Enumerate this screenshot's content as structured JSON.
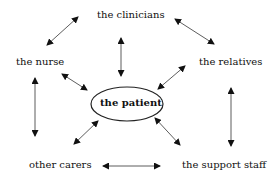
{
  "diagram": {
    "center": "the patient",
    "nodes": {
      "clinicians": "the clinicians",
      "nurse": "the nurse",
      "relatives": "the relatives",
      "carers": "other carers",
      "support": "the support staff"
    },
    "edges": [
      [
        "the clinicians",
        "the nurse"
      ],
      [
        "the clinicians",
        "the relatives"
      ],
      [
        "the clinicians",
        "the patient"
      ],
      [
        "the nurse",
        "the patient"
      ],
      [
        "the relatives",
        "the patient"
      ],
      [
        "the nurse",
        "other carers"
      ],
      [
        "the relatives",
        "the support staff"
      ],
      [
        "other carers",
        "the patient"
      ],
      [
        "the support staff",
        "the patient"
      ],
      [
        "other carers",
        "the support staff"
      ]
    ]
  }
}
